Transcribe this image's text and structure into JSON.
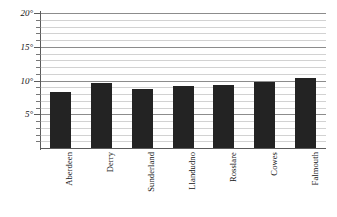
{
  "chart_data": {
    "type": "bar",
    "title": "",
    "subtitle": "",
    "xlabel": "",
    "ylabel": "",
    "categories": [
      "Aberdeen",
      "Derry",
      "Sunderland",
      "Llandudno",
      "Rosslare",
      "Cowes",
      "Falmouth"
    ],
    "values": [
      8.3,
      9.6,
      8.7,
      9.2,
      9.3,
      9.8,
      10.4
    ],
    "ylim": [
      0,
      20
    ],
    "y_major_ticks": [
      5,
      10,
      15,
      20
    ],
    "y_major_tick_labels": [
      "5°",
      "10°",
      "15°",
      "20°"
    ],
    "y_minor_tick_interval": 1,
    "grid": true,
    "grid_axis": "y",
    "legend": false,
    "legend_position": "none",
    "bar_color": "#232323",
    "grid_major_color": "#8c8c8c",
    "grid_minor_color": "#d2d2d2",
    "axis_color": "#5b5b5b",
    "background_color": "#ffffff",
    "annotations": []
  },
  "axis": {
    "y_labels": [
      "20°",
      "15°",
      "10°",
      "5°"
    ],
    "x_labels": [
      "Aberdeen",
      "Derry",
      "Sunderland",
      "Llandudno",
      "Rosslare",
      "Cowes",
      "Falmouth"
    ]
  }
}
